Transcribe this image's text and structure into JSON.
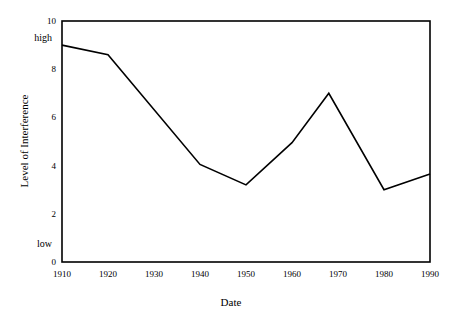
{
  "chart_data": {
    "type": "line",
    "title": "",
    "xlabel": "Date",
    "ylabel": "Level of Interference",
    "x": [
      1910,
      1920,
      1940,
      1950,
      1960,
      1968,
      1980,
      1990
    ],
    "values": [
      9.0,
      8.6,
      4.05,
      3.2,
      4.95,
      7.0,
      3.0,
      3.65
    ],
    "series": [
      {
        "name": "Level of Interference",
        "x": [
          1910,
          1920,
          1940,
          1950,
          1960,
          1968,
          1980,
          1990
        ],
        "values": [
          9.0,
          8.6,
          4.05,
          3.2,
          4.95,
          7.0,
          3.0,
          3.65
        ]
      }
    ],
    "xlim": [
      1910,
      1990
    ],
    "ylim": [
      0,
      10
    ],
    "xticks": [
      1910,
      1920,
      1930,
      1940,
      1950,
      1960,
      1970,
      1980,
      1990
    ],
    "xtick_labels": [
      "1910",
      "1920",
      "1930",
      "1940",
      "1950",
      "1960",
      "1970",
      "1980",
      "1990"
    ],
    "yticks": [
      0,
      2,
      4,
      6,
      8,
      10
    ],
    "ytick_labels": [
      "0",
      "2",
      "4",
      "6",
      "8",
      "10"
    ],
    "grid": false,
    "legend": null,
    "legend_position": "none",
    "line_color": "#000000",
    "background_color": "#ffffff",
    "annotations": [
      {
        "text": "high",
        "value": 9.3,
        "position": "y-axis-outside"
      },
      {
        "text": "low",
        "value": 0.75,
        "position": "y-axis-outside"
      }
    ]
  }
}
